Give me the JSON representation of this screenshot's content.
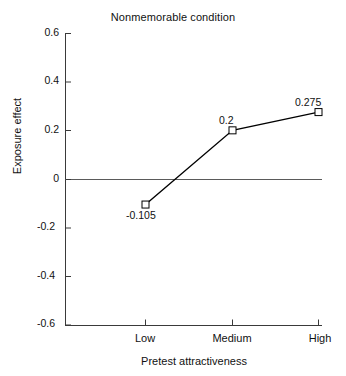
{
  "chart_data": {
    "type": "line",
    "title": "Nonmemorable condition",
    "xlabel": "Pretest attractiveness",
    "ylabel": "Exposure effect",
    "categories": [
      "Low",
      "Medium",
      "High"
    ],
    "values": [
      -0.105,
      0.2,
      0.275
    ],
    "point_labels": [
      "-0.105",
      "0.2",
      "0.275"
    ],
    "ylim": [
      -0.6,
      0.6
    ],
    "yticks": [
      0.6,
      0.4,
      0.2,
      0,
      -0.2,
      -0.4,
      -0.6
    ],
    "ytick_labels": [
      "0.6",
      "0.4",
      "0.2",
      "0",
      "-0.2",
      "-0.4",
      "-0.6"
    ],
    "grid": false,
    "legend": false,
    "marker": "open-square",
    "reference_line": 0,
    "series": [
      {
        "name": "Nonmemorable condition",
        "values": [
          -0.105,
          0.2,
          0.275
        ]
      }
    ],
    "colors": {
      "line": "#000000",
      "marker_fill": "#ffffff",
      "marker_stroke": "#000000",
      "axis": "#3a3a3a",
      "text": "#111111",
      "background": "#ffffff"
    }
  }
}
